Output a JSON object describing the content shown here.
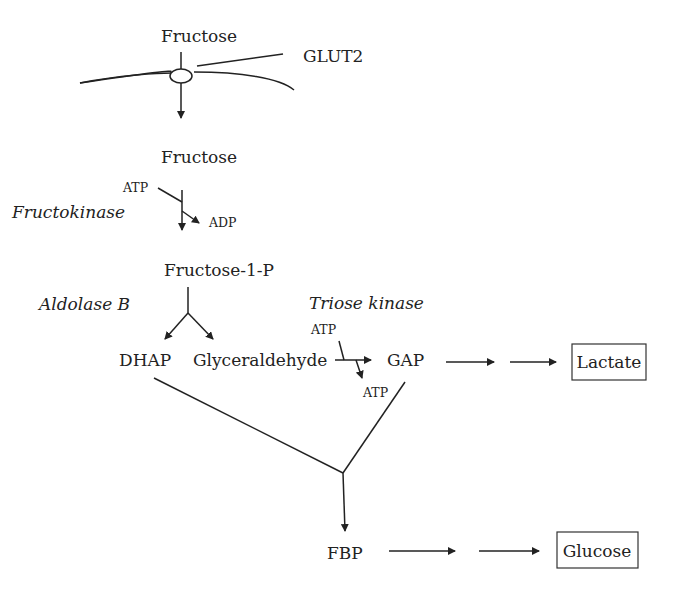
{
  "diagram": {
    "membrane": {
      "transporter_label": "GLUT2",
      "substrate_outside": "Fructose"
    },
    "nodes": {
      "fructose_in": "Fructose",
      "fructose_1_p": "Fructose-1-P",
      "dhap": "DHAP",
      "glyceraldehyde": "Glyceraldehyde",
      "gap": "GAP",
      "lactate": "Lactate",
      "fbp": "FBP",
      "glucose": "Glucose"
    },
    "enzymes": {
      "fructokinase": "Fructokinase",
      "aldolase_b": "Aldolase B",
      "triose_kinase": "Triose kinase"
    },
    "cofactors": {
      "fructokinase_in": "ATP",
      "fructokinase_out": "ADP",
      "triose_kinase_in": "ATP",
      "triose_kinase_out": "ATP"
    },
    "edges": [
      {
        "from": "Fructose (extracellular)",
        "to": "Fructose",
        "via": "GLUT2"
      },
      {
        "from": "Fructose",
        "to": "Fructose-1-P",
        "enzyme": "Fructokinase",
        "cofactor_in": "ATP",
        "cofactor_out": "ADP"
      },
      {
        "from": "Fructose-1-P",
        "to": [
          "DHAP",
          "Glyceraldehyde"
        ],
        "enzyme": "Aldolase B"
      },
      {
        "from": "Glyceraldehyde",
        "to": "GAP",
        "enzyme": "Triose kinase",
        "cofactor_in": "ATP",
        "cofactor_out": "ATP"
      },
      {
        "from": "GAP",
        "to": "Lactate",
        "steps": 2
      },
      {
        "from": [
          "DHAP",
          "GAP"
        ],
        "to": "FBP"
      },
      {
        "from": "FBP",
        "to": "Glucose",
        "steps": 2
      }
    ]
  }
}
